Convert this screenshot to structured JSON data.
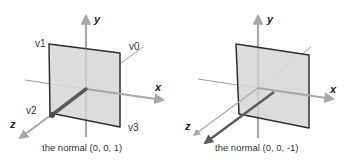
{
  "left_panel": {
    "axes": {
      "x": "x",
      "y": "y",
      "z": "z"
    },
    "vertices": {
      "v0": "v0",
      "v1": "v1",
      "v2": "v2",
      "v3": "v3"
    },
    "caption": "the normal (0, 0, 1)"
  },
  "right_panel": {
    "axes": {
      "x": "x",
      "y": "y",
      "z": "z"
    },
    "caption": "the normal (0, 0, -1)"
  },
  "colors": {
    "axis": "#9a9a9a",
    "quad_fill": "#d6d6d6",
    "quad_edge": "#333333",
    "normal": "#666666"
  }
}
